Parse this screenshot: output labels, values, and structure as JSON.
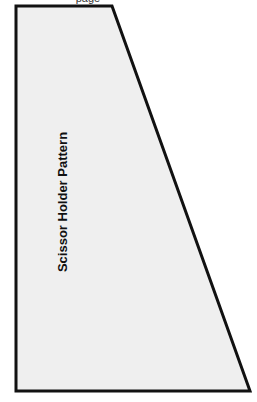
{
  "header": {
    "clipped_text": "page"
  },
  "pattern": {
    "label": "Scissor Holder Pattern",
    "shape": "trapezoid",
    "fill_color": "#efefef",
    "stroke_color": "#111111",
    "points": [
      [
        16,
        6
      ],
      [
        112,
        6
      ],
      [
        250,
        391
      ],
      [
        16,
        391
      ]
    ]
  }
}
